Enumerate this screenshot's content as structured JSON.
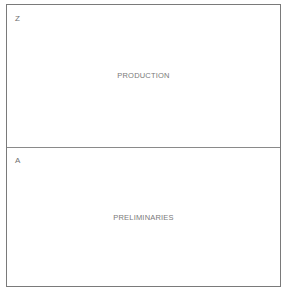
{
  "diagram": {
    "sections": [
      {
        "letter": "Z",
        "label": "PRODUCTION"
      },
      {
        "letter": "A",
        "label": "PRELIMINARIES"
      }
    ]
  }
}
